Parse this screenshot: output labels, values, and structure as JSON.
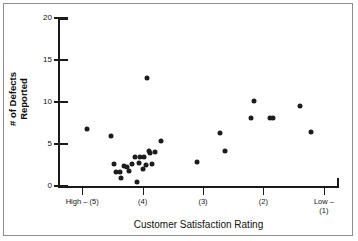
{
  "chart_data": {
    "type": "scatter",
    "title": "",
    "xlabel": "Customer Satisfaction Rating",
    "ylabel": "# of Defects Reported",
    "ylabel_line1": "# of Defects",
    "ylabel_line2": "Reported",
    "ylim": [
      0,
      20
    ],
    "yticks": [
      0,
      5,
      10,
      15,
      20
    ],
    "ytick_labels": [
      "0",
      "5",
      "10",
      "15",
      "20"
    ],
    "xlim": [
      5.4,
      0.75
    ],
    "xticks": [
      5,
      4,
      3,
      2,
      1
    ],
    "xtick_labels": [
      "High – (5)",
      "(4)",
      "(3)",
      "(2)",
      "Low –\n(1)"
    ],
    "xtick_label_low_line1": "Low –",
    "xtick_label_low_line2": "(1)",
    "grid": false,
    "legend": false,
    "marker_color": "#1c1c1c",
    "axis_color": "#1a1a1a",
    "background": "#ffffff",
    "n_points": 30,
    "points": [
      {
        "x": 4.92,
        "y": 6.8
      },
      {
        "x": 4.52,
        "y": 5.9
      },
      {
        "x": 4.47,
        "y": 2.6
      },
      {
        "x": 4.44,
        "y": 1.7
      },
      {
        "x": 4.38,
        "y": 1.7
      },
      {
        "x": 4.36,
        "y": 1.0
      },
      {
        "x": 4.3,
        "y": 2.4
      },
      {
        "x": 4.26,
        "y": 2.3
      },
      {
        "x": 4.22,
        "y": 1.8
      },
      {
        "x": 4.18,
        "y": 2.6
      },
      {
        "x": 4.13,
        "y": 3.4
      },
      {
        "x": 4.1,
        "y": 0.5
      },
      {
        "x": 4.06,
        "y": 2.7
      },
      {
        "x": 4.04,
        "y": 3.4
      },
      {
        "x": 4.0,
        "y": 2.0
      },
      {
        "x": 3.98,
        "y": 3.5
      },
      {
        "x": 3.95,
        "y": 2.5
      },
      {
        "x": 3.92,
        "y": 12.8
      },
      {
        "x": 3.9,
        "y": 4.2
      },
      {
        "x": 3.88,
        "y": 3.9
      },
      {
        "x": 3.84,
        "y": 2.6
      },
      {
        "x": 3.8,
        "y": 4.0
      },
      {
        "x": 3.7,
        "y": 5.3
      },
      {
        "x": 3.1,
        "y": 2.9
      },
      {
        "x": 2.72,
        "y": 6.3
      },
      {
        "x": 2.64,
        "y": 4.2
      },
      {
        "x": 2.16,
        "y": 10.1
      },
      {
        "x": 2.2,
        "y": 8.1
      },
      {
        "x": 1.9,
        "y": 8.1
      },
      {
        "x": 1.84,
        "y": 8.1
      },
      {
        "x": 1.4,
        "y": 9.5
      },
      {
        "x": 1.22,
        "y": 6.4
      }
    ]
  }
}
